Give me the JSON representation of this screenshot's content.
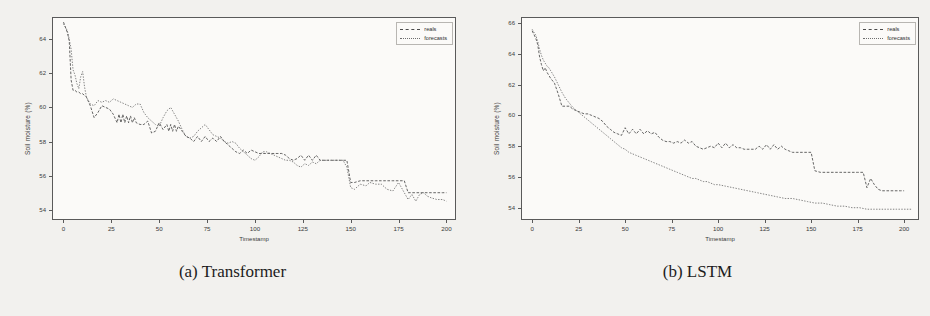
{
  "figure": {
    "panels": [
      {
        "id": "transformer",
        "caption": "(a) Transformer",
        "axes": {
          "xlabel": "Timestamp",
          "ylabel": "Soil moisture (%)",
          "xticks": [
            "0",
            "25",
            "50",
            "75",
            "100",
            "125",
            "150",
            "175",
            "200"
          ],
          "yticks": [
            "54",
            "56",
            "58",
            "60",
            "62",
            "64"
          ]
        },
        "legend": {
          "items": [
            {
              "label": "reals",
              "style": "dashed",
              "color": "#4a4a4a"
            },
            {
              "label": "forecasts",
              "style": "dotted",
              "color": "#6e6e6e"
            }
          ]
        }
      },
      {
        "id": "lstm",
        "caption": "(b) LSTM",
        "axes": {
          "xlabel": "Timestamp",
          "ylabel": "Soil moisture (%)",
          "xticks": [
            "0",
            "25",
            "50",
            "75",
            "100",
            "125",
            "150",
            "175",
            "200"
          ],
          "yticks": [
            "54",
            "56",
            "58",
            "60",
            "62",
            "64",
            "66"
          ]
        },
        "legend": {
          "items": [
            {
              "label": "reals",
              "style": "dashed",
              "color": "#4a4a4a"
            },
            {
              "label": "forecasts",
              "style": "dotted",
              "color": "#6e6e6e"
            }
          ]
        }
      }
    ]
  },
  "chart_data": [
    {
      "type": "line",
      "title": "(a) Transformer",
      "xlabel": "Timestamp",
      "ylabel": "Soil moisture (%)",
      "xlim": [
        -6,
        205
      ],
      "ylim": [
        53.4,
        65.3
      ],
      "grid": false,
      "legend_position": "upper right",
      "xticks": [
        0,
        25,
        50,
        75,
        100,
        125,
        150,
        175,
        200
      ],
      "yticks": [
        54,
        56,
        58,
        60,
        62,
        64
      ],
      "series": [
        {
          "name": "reals",
          "style": "dashed",
          "color": "#4a4a4a",
          "x": [
            0,
            2,
            3,
            4,
            5,
            6,
            7,
            8,
            9,
            10,
            12,
            14,
            16,
            18,
            20,
            22,
            24,
            26,
            28,
            29,
            30,
            31,
            32,
            33,
            34,
            35,
            36,
            37,
            38,
            40,
            42,
            44,
            46,
            48,
            50,
            52,
            54,
            55,
            56,
            57,
            58,
            59,
            60,
            62,
            64,
            66,
            68,
            70,
            72,
            74,
            76,
            78,
            80,
            82,
            84,
            86,
            88,
            90,
            92,
            94,
            96,
            98,
            100,
            102,
            104,
            106,
            108,
            110,
            112,
            114,
            116,
            118,
            120,
            122,
            124,
            126,
            128,
            130,
            132,
            134,
            136,
            138,
            140,
            142,
            144,
            146,
            148,
            150,
            152,
            155,
            158,
            160,
            163,
            166,
            169,
            172,
            175,
            178,
            180,
            182,
            184,
            186,
            188,
            190,
            192,
            195,
            198,
            200
          ],
          "y": [
            65.0,
            64.4,
            63.9,
            61.6,
            61.0,
            61.0,
            60.9,
            60.9,
            60.8,
            60.8,
            60.6,
            60.1,
            59.4,
            59.7,
            60.1,
            60.0,
            59.9,
            59.6,
            59.1,
            59.6,
            59.1,
            59.6,
            59.1,
            59.5,
            59.1,
            59.5,
            59.1,
            59.4,
            59.1,
            59.0,
            59.0,
            59.2,
            58.5,
            58.6,
            59.1,
            58.7,
            59.0,
            58.6,
            59.0,
            58.6,
            59.0,
            58.6,
            58.9,
            58.6,
            58.3,
            58.2,
            58.0,
            58.3,
            58.0,
            58.3,
            58.0,
            58.2,
            58.0,
            58.3,
            58.0,
            57.8,
            57.6,
            57.4,
            57.3,
            57.5,
            57.3,
            57.5,
            57.4,
            57.3,
            57.3,
            57.3,
            57.3,
            57.3,
            57.3,
            57.3,
            57.2,
            57.0,
            56.9,
            57.0,
            57.2,
            56.9,
            57.2,
            56.9,
            57.2,
            56.9,
            56.9,
            56.9,
            56.9,
            56.9,
            56.9,
            56.9,
            56.9,
            55.6,
            55.6,
            55.7,
            55.7,
            55.7,
            55.7,
            55.7,
            55.7,
            55.7,
            55.7,
            55.7,
            55.0,
            55.0,
            55.0,
            55.0,
            55.0,
            55.0,
            55.0,
            55.0,
            55.0,
            55.0
          ]
        },
        {
          "name": "forecasts",
          "style": "dotted",
          "color": "#6e6e6e",
          "x": [
            0,
            2,
            3,
            4,
            5,
            6,
            7,
            8,
            9,
            10,
            11,
            12,
            14,
            16,
            18,
            20,
            22,
            24,
            26,
            28,
            30,
            32,
            34,
            36,
            38,
            40,
            42,
            44,
            46,
            48,
            50,
            52,
            54,
            56,
            58,
            60,
            62,
            64,
            66,
            68,
            70,
            72,
            74,
            76,
            78,
            80,
            82,
            84,
            86,
            88,
            90,
            92,
            94,
            96,
            98,
            100,
            102,
            104,
            106,
            108,
            110,
            112,
            114,
            116,
            118,
            120,
            122,
            124,
            126,
            128,
            130,
            132,
            134,
            136,
            138,
            140,
            142,
            144,
            146,
            148,
            150,
            152,
            155,
            158,
            160,
            163,
            166,
            169,
            172,
            175,
            178,
            180,
            182,
            184,
            186,
            188,
            190,
            192,
            195,
            198,
            200
          ],
          "y": [
            64.9,
            64.5,
            64.0,
            63.4,
            62.2,
            61.9,
            61.4,
            61.1,
            61.8,
            62.1,
            61.2,
            60.6,
            60.2,
            60.1,
            60.4,
            60.3,
            60.4,
            60.3,
            60.5,
            60.4,
            60.3,
            60.2,
            60.1,
            60.0,
            60.2,
            60.2,
            59.7,
            59.4,
            59.2,
            59.0,
            58.9,
            59.4,
            59.8,
            60.0,
            59.6,
            59.2,
            58.7,
            58.3,
            58.2,
            58.3,
            58.6,
            58.8,
            59.0,
            58.7,
            58.4,
            58.3,
            58.2,
            58.0,
            57.9,
            58.0,
            57.9,
            57.6,
            57.4,
            57.2,
            57.0,
            56.9,
            57.1,
            57.4,
            57.4,
            57.3,
            57.2,
            57.1,
            57.0,
            56.9,
            56.9,
            56.8,
            56.6,
            56.5,
            56.7,
            56.6,
            56.8,
            56.7,
            56.9,
            56.9,
            56.9,
            56.9,
            56.9,
            56.9,
            56.9,
            56.5,
            55.3,
            55.2,
            55.5,
            55.4,
            55.6,
            55.5,
            55.5,
            55.2,
            55.1,
            55.6,
            55.0,
            54.6,
            54.9,
            54.5,
            54.9,
            55.0,
            54.8,
            54.7,
            54.6,
            54.6,
            54.5
          ]
        }
      ]
    },
    {
      "type": "line",
      "title": "(b) LSTM",
      "xlabel": "Timestamp",
      "ylabel": "Soil moisture (%)",
      "xlim": [
        -6,
        208
      ],
      "ylim": [
        53.2,
        66.4
      ],
      "grid": false,
      "legend_position": "upper right",
      "xticks": [
        0,
        25,
        50,
        75,
        100,
        125,
        150,
        175,
        200
      ],
      "yticks": [
        54,
        56,
        58,
        60,
        62,
        64,
        66
      ],
      "series": [
        {
          "name": "reals",
          "style": "dashed",
          "color": "#4a4a4a",
          "x": [
            0,
            2,
            3,
            4,
            5,
            6,
            7,
            8,
            9,
            10,
            12,
            14,
            16,
            18,
            20,
            22,
            24,
            26,
            28,
            30,
            32,
            34,
            36,
            38,
            40,
            42,
            44,
            46,
            48,
            50,
            52,
            54,
            56,
            58,
            60,
            62,
            64,
            66,
            68,
            70,
            72,
            74,
            76,
            78,
            80,
            82,
            84,
            86,
            88,
            90,
            92,
            94,
            96,
            98,
            100,
            102,
            104,
            106,
            108,
            110,
            112,
            114,
            116,
            118,
            120,
            122,
            124,
            126,
            128,
            130,
            132,
            134,
            136,
            138,
            140,
            142,
            144,
            146,
            148,
            150,
            152,
            155,
            158,
            160,
            163,
            166,
            169,
            172,
            175,
            178,
            180,
            182,
            184,
            186,
            188,
            190,
            192,
            195,
            198,
            200
          ],
          "y": [
            65.5,
            65.0,
            64.6,
            63.8,
            63.3,
            62.9,
            63.1,
            62.8,
            62.6,
            62.4,
            62.1,
            61.4,
            60.6,
            60.6,
            60.6,
            60.4,
            60.3,
            60.2,
            60.1,
            60.1,
            60.0,
            59.9,
            59.8,
            59.6,
            59.3,
            59.1,
            58.9,
            58.8,
            58.7,
            59.2,
            58.8,
            59.1,
            58.8,
            59.1,
            58.8,
            59.0,
            58.8,
            58.9,
            58.6,
            58.4,
            58.3,
            58.3,
            58.2,
            58.3,
            58.2,
            58.4,
            58.2,
            58.3,
            58.0,
            57.9,
            57.8,
            57.9,
            58.0,
            57.9,
            58.2,
            57.9,
            58.2,
            57.9,
            58.1,
            57.9,
            57.9,
            57.8,
            57.8,
            57.8,
            57.8,
            58.0,
            57.8,
            58.1,
            57.8,
            58.1,
            57.8,
            58.0,
            57.8,
            57.7,
            57.6,
            57.6,
            57.6,
            57.6,
            57.6,
            57.6,
            56.4,
            56.3,
            56.3,
            56.3,
            56.3,
            56.3,
            56.3,
            56.3,
            56.3,
            56.3,
            55.3,
            55.9,
            55.5,
            55.2,
            55.1,
            55.1,
            55.1,
            55.1,
            55.1,
            55.1
          ]
        },
        {
          "name": "forecasts",
          "style": "dotted",
          "color": "#6e6e6e",
          "x": [
            0,
            2,
            3,
            4,
            5,
            6,
            7,
            8,
            9,
            10,
            12,
            14,
            16,
            18,
            20,
            22,
            24,
            26,
            28,
            30,
            32,
            34,
            36,
            38,
            40,
            42,
            44,
            46,
            48,
            50,
            52,
            54,
            56,
            58,
            60,
            62,
            64,
            66,
            68,
            70,
            72,
            74,
            76,
            78,
            80,
            82,
            84,
            86,
            88,
            90,
            92,
            94,
            96,
            98,
            100,
            104,
            108,
            112,
            116,
            120,
            124,
            128,
            132,
            136,
            140,
            144,
            148,
            152,
            156,
            160,
            164,
            168,
            172,
            176,
            180,
            184,
            188,
            192,
            196,
            200,
            204
          ],
          "y": [
            65.6,
            65.2,
            64.8,
            64.3,
            63.9,
            63.6,
            63.4,
            63.2,
            63.1,
            62.9,
            62.5,
            62.0,
            61.5,
            61.1,
            60.8,
            60.5,
            60.3,
            60.1,
            59.9,
            59.7,
            59.5,
            59.3,
            59.1,
            58.9,
            58.7,
            58.5,
            58.3,
            58.1,
            57.9,
            57.8,
            57.6,
            57.5,
            57.4,
            57.3,
            57.2,
            57.1,
            57.0,
            56.9,
            56.8,
            56.7,
            56.6,
            56.5,
            56.4,
            56.3,
            56.2,
            56.1,
            56.0,
            55.9,
            55.9,
            55.8,
            55.7,
            55.7,
            55.6,
            55.5,
            55.5,
            55.4,
            55.3,
            55.2,
            55.1,
            55.0,
            54.9,
            54.8,
            54.7,
            54.6,
            54.6,
            54.5,
            54.4,
            54.3,
            54.3,
            54.2,
            54.1,
            54.1,
            54.0,
            54.0,
            53.9,
            53.9,
            53.9,
            53.9,
            53.9,
            53.9,
            53.9
          ]
        }
      ]
    }
  ]
}
